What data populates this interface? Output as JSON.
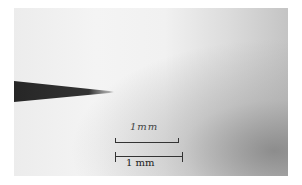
{
  "image": {
    "subject": "micrograph of needle tip with scale bars",
    "handwritten_label": "1mm",
    "scale_bar_label": "1 mm",
    "colors": {
      "needle": "#2a2a2a",
      "background_light": "#f2f2f2",
      "background_dark": "#9a9a9a"
    }
  }
}
